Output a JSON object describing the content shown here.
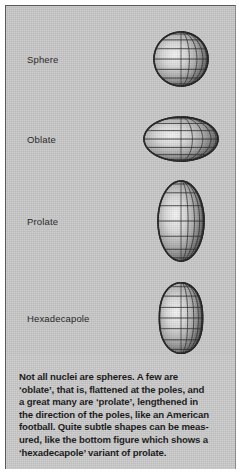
{
  "panel": {
    "background_color": "#c8c8c8",
    "border_color": "#5a5a5a"
  },
  "figure": {
    "shapes": [
      {
        "label": "Sphere",
        "name": "sphere",
        "cx": 175,
        "cy": 53,
        "rx": 27,
        "ry": 27,
        "type": "ellipsoid"
      },
      {
        "label": "Oblate",
        "name": "oblate",
        "cx": 175,
        "cy": 133,
        "rx": 37,
        "ry": 22,
        "type": "ellipsoid"
      },
      {
        "label": "Prolate",
        "name": "prolate",
        "cx": 175,
        "cy": 215,
        "rx": 23,
        "ry": 40,
        "type": "ellipsoid"
      },
      {
        "label": "Hexadecapole",
        "name": "hexadecapole",
        "cx": 175,
        "cy": 312,
        "rx": 27,
        "ry": 33,
        "type": "hexadecapole"
      }
    ],
    "mesh": {
      "longitude_lines": 10,
      "latitude_lines": 7,
      "line_color": "#2b2b2b",
      "highlight_color": "#f2f2f2",
      "shadow_color": "#4a4a4a"
    }
  },
  "caption": {
    "lines": [
      "Not all nuclei are spheres.  A few are",
      "‘oblate’, that is, flattened at the poles, and",
      "a great many are ‘prolate’, lengthened in",
      "the direction of the poles, like an American",
      "football. Quite subtle shapes can be meas-",
      "ured, like the bottom figure which shows a",
      "‘hexadecapole’ variant of prolate."
    ]
  }
}
